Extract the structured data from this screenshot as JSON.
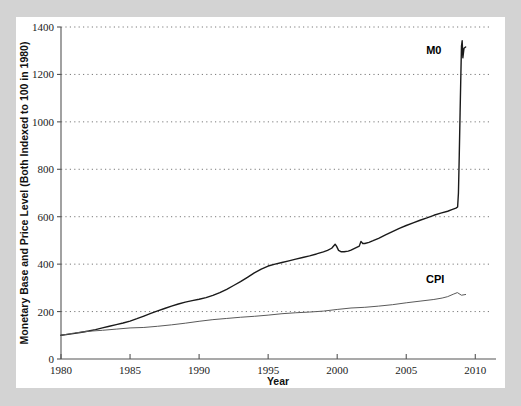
{
  "figure": {
    "background_color": "#d3d3d3",
    "card_color": "#ffffff"
  },
  "chart_data": {
    "type": "line",
    "title": "",
    "xlabel": "Year",
    "ylabel": "Monetary Base and Price Level (Both Indexed to 100 in 1980)",
    "xlim": [
      1980,
      2011.5
    ],
    "ylim": [
      0,
      1400
    ],
    "xticks": [
      1980,
      1985,
      1990,
      1995,
      2000,
      2005,
      2010
    ],
    "xticklabels": [
      "1980",
      "1985",
      "1990",
      "1995",
      "2000",
      "2005",
      "2010"
    ],
    "yticks": [
      0,
      200,
      400,
      600,
      800,
      1000,
      1200,
      1400
    ],
    "yticklabels": [
      "0",
      "200",
      "400",
      "600",
      "800",
      "1000",
      "1200",
      "1400"
    ],
    "grid": "horizontal-dotted",
    "legend_position": "inline-annotations",
    "series": [
      {
        "name": "M0",
        "label": "M0",
        "color": "#1a1a1a",
        "width": 1.4,
        "label_x": 2007.0,
        "label_y": 1285,
        "x": [
          1980.0,
          1980.5,
          1981.0,
          1981.5,
          1982.0,
          1982.5,
          1983.0,
          1983.5,
          1984.0,
          1984.5,
          1985.0,
          1985.5,
          1986.0,
          1986.5,
          1987.0,
          1987.5,
          1988.0,
          1988.5,
          1989.0,
          1989.5,
          1990.0,
          1990.5,
          1991.0,
          1991.5,
          1992.0,
          1992.5,
          1993.0,
          1993.5,
          1994.0,
          1994.5,
          1995.0,
          1995.5,
          1996.0,
          1996.5,
          1997.0,
          1997.5,
          1998.0,
          1998.5,
          1999.0,
          1999.3,
          1999.6,
          1999.85,
          1999.95,
          2000.1,
          2000.3,
          2000.5,
          2000.8,
          2001.0,
          2001.3,
          2001.6,
          2001.72,
          2001.85,
          2002.0,
          2002.3,
          2002.6,
          2003.0,
          2003.5,
          2004.0,
          2004.5,
          2005.0,
          2005.5,
          2006.0,
          2006.5,
          2007.0,
          2007.5,
          2008.0,
          2008.3,
          2008.6,
          2008.72,
          2008.78,
          2008.84,
          2008.9,
          2008.96,
          2009.0,
          2009.05,
          2009.1,
          2009.18,
          2009.3
        ],
        "y": [
          100,
          104,
          108,
          113,
          118,
          124,
          131,
          138,
          145,
          152,
          160,
          170,
          181,
          192,
          203,
          213,
          223,
          232,
          240,
          246,
          252,
          259,
          268,
          280,
          294,
          310,
          326,
          344,
          363,
          379,
          392,
          400,
          407,
          414,
          421,
          428,
          435,
          443,
          452,
          458,
          467,
          484,
          476,
          458,
          452,
          452,
          455,
          459,
          468,
          476,
          496,
          487,
          487,
          492,
          499,
          509,
          523,
          537,
          551,
          563,
          574,
          585,
          595,
          606,
          615,
          623,
          630,
          636,
          641,
          700,
          860,
          1040,
          1210,
          1320,
          1342,
          1270,
          1310,
          1316
        ]
      },
      {
        "name": "CPI",
        "label": "CPI",
        "color": "#5a5a5a",
        "width": 1.0,
        "label_x": 2007.1,
        "label_y": 320,
        "x": [
          1980.0,
          1981.0,
          1982.0,
          1983.0,
          1984.0,
          1985.0,
          1986.0,
          1987.0,
          1988.0,
          1989.0,
          1990.0,
          1991.0,
          1992.0,
          1993.0,
          1994.0,
          1995.0,
          1996.0,
          1997.0,
          1998.0,
          1999.0,
          2000.0,
          2001.0,
          2002.0,
          2003.0,
          2004.0,
          2005.0,
          2006.0,
          2007.0,
          2007.6,
          2008.0,
          2008.4,
          2008.7,
          2009.0,
          2009.3
        ],
        "y": [
          100,
          110,
          117,
          121,
          126,
          131,
          133,
          138,
          144,
          151,
          159,
          166,
          171,
          176,
          180,
          185,
          191,
          195,
          198,
          202,
          209,
          215,
          218,
          223,
          229,
          237,
          244,
          251,
          257,
          263,
          273,
          280,
          269,
          272
        ]
      }
    ]
  }
}
